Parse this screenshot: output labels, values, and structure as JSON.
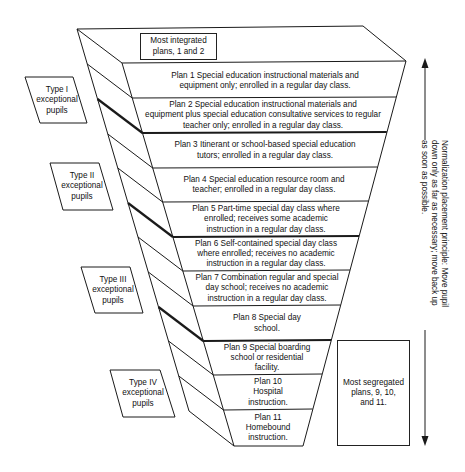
{
  "diagram": {
    "top_box": "Most integrated\nplans, 1 and 2",
    "bottom_box": "Most segregated\nplans, 9, 10,\nand 11.",
    "principle_text": "Normalization placement principle: Move pupil\ndown only as far as necessary; move back up\nas soon as possible.",
    "plans": [
      {
        "label": "Plan 1 Special education instructional materials and\nequipment only; enrolled in a regular day class."
      },
      {
        "label": "Plan 2 Special education instructional materials and\nequipment plus special education consultative services to regular\nteacher only; enrolled in a regular day class."
      },
      {
        "label": "Plan 3 Itinerant or school-based special education\ntutors; enrolled in a regular day class."
      },
      {
        "label": "Plan 4 Special education resource room and\nteacher; enrolled in a regular day class."
      },
      {
        "label": "Plan 5 Part-time special day class where\nenrolled; receives some academic\ninstruction in a regular day class."
      },
      {
        "label": "Plan 6 Self-contained special day class\nwhere enrolled; receives no academic\ninstruction in a regular day class."
      },
      {
        "label": "Plan 7 Combination regular and special\nday school; receives no academic\ninstruction in a regular day class."
      },
      {
        "label": "Plan 8 Special day\nschool."
      },
      {
        "label": "Plan 9 Special boarding\nschool or residential\nfacility."
      },
      {
        "label": "Plan 10\nHospital\ninstruction."
      },
      {
        "label": "Plan 11\nHomebound\ninstruction."
      }
    ],
    "pupil_types": [
      {
        "label": "Type I\nexceptional\npupils"
      },
      {
        "label": "Type II\nexceptional\npupils"
      },
      {
        "label": "Type III\nexceptional\npupils"
      },
      {
        "label": "Type IV\nexceptional\npupils"
      }
    ],
    "arrow_up": "arrow-up",
    "arrow_down": "arrow-down",
    "line_color": "#1a1a1a"
  }
}
